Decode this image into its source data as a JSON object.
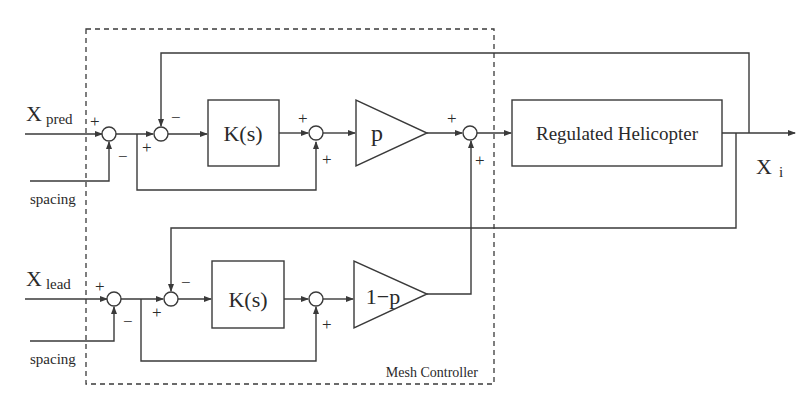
{
  "diagram": {
    "type": "block-diagram",
    "container": {
      "label": "Mesh Controller"
    },
    "inputs": {
      "top": {
        "main": "X",
        "sub": "pred",
        "offset": "spacing"
      },
      "bottom": {
        "main": "X",
        "sub": "lead",
        "offset": "spacing"
      }
    },
    "output": {
      "main": "X",
      "sub": "i"
    },
    "blocks": {
      "controller_top": "K(s)",
      "controller_bottom": "K(s)",
      "gain_top": "p",
      "gain_bottom": "1−p",
      "plant": "Regulated Helicopter"
    },
    "signs": {
      "plus": "+",
      "minus": "−"
    }
  }
}
